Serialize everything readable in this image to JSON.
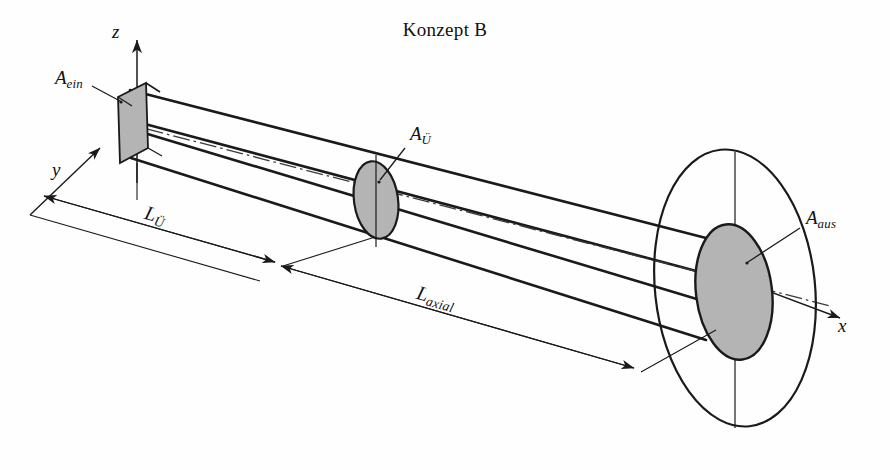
{
  "figure": {
    "title": "Konzept B",
    "type": "technical-line-diagram",
    "background_color": "#fefefe",
    "line_color": "#1a1a1a",
    "fill_color": "#b4b4b4"
  },
  "axes": {
    "z": {
      "label": "z"
    },
    "y": {
      "label": "y"
    },
    "x": {
      "label": "x"
    }
  },
  "apertures": {
    "entrance": {
      "label_base": "A",
      "label_sub": "ein"
    },
    "transfer": {
      "label_base": "A",
      "label_sub": "Ü"
    },
    "exit": {
      "label_base": "A",
      "label_sub": "aus"
    }
  },
  "dimensions": {
    "transfer_length": {
      "label_base": "L",
      "label_sub": "Ü"
    },
    "axial_length": {
      "label_base": "L",
      "label_sub": "axial"
    }
  }
}
